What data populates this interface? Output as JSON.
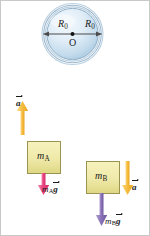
{
  "figure": {
    "colors": {
      "pulley_fill_light": "#eef5fb",
      "pulley_fill_mid": "#cfe2f0",
      "pulley_fill_dark": "#a9c6dd",
      "pulley_rim": "#8fb0c9",
      "block_fill": "#f2eeb3",
      "block_fill_dark": "#e3dd95",
      "block_stroke": "#9a9452",
      "rope": "#9a9a9a",
      "accel_arrow": "#f5b731",
      "weight_a_arrow": "#e8447f",
      "weight_b_arrow": "#8a72b8",
      "axis_line": "#4a4a4a",
      "text": "#1a1a1a"
    }
  },
  "pulley": {
    "radius_label_left": "R",
    "radius_label_left_sub": "0",
    "radius_label_right": "R",
    "radius_label_right_sub": "0",
    "center_label": "O"
  },
  "block_a": {
    "mass_symbol": "m",
    "mass_subscript": "A",
    "accel_label": "a",
    "accel_direction": "up",
    "weight_symbol": "m",
    "weight_subscript": "A",
    "weight_vector": "g",
    "weight_direction": "down"
  },
  "block_b": {
    "mass_symbol": "m",
    "mass_subscript": "B",
    "accel_label": "a",
    "accel_direction": "down",
    "weight_symbol": "m",
    "weight_subscript": "B",
    "weight_vector": "g",
    "weight_direction": "down"
  }
}
